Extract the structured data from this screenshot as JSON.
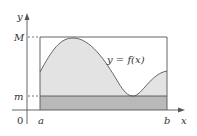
{
  "figure": {
    "type": "diagram",
    "labels": {
      "y_axis": "y",
      "x_axis": "x",
      "origin": "0",
      "upper_bound": "M",
      "lower_bound": "m",
      "left_endpoint": "a",
      "right_endpoint": "b",
      "curve": "y = f(x)"
    },
    "colors": {
      "curve_fill": "#e3e3e3",
      "min_rect_fill": "#b9b9b9",
      "lines": "#555555",
      "background": "#ffffff"
    }
  }
}
